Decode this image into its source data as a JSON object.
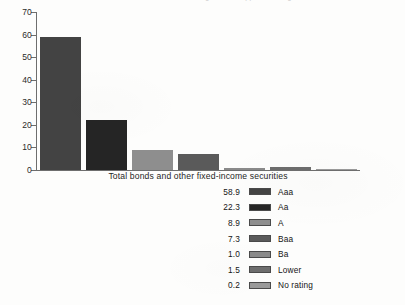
{
  "chart_data": {
    "type": "bar",
    "title": "",
    "subtitle": "",
    "xlabel": "Total bonds and other fixed-income securities",
    "ylabel": "",
    "categories": [
      "Aaa",
      "Aa",
      "A",
      "Baa",
      "Ba",
      "Lower",
      "No rating"
    ],
    "values": [
      58.9,
      22.3,
      8.9,
      7.3,
      1.0,
      1.5,
      0.2
    ],
    "value_labels": [
      "58.9",
      "22.3",
      "8.9",
      "7.3",
      "1.0",
      "1.5",
      "0.2"
    ],
    "ylim": [
      0,
      70
    ],
    "yticks": [
      0,
      10,
      20,
      30,
      40,
      50,
      60,
      70
    ],
    "ytick_labels": [
      "0",
      "10",
      "20",
      "30",
      "40",
      "50",
      "60",
      "70"
    ],
    "grid": false,
    "legend_position": "below",
    "series": [
      {
        "name": "Total bonds and other fixed-income securities",
        "values": [
          58.9,
          22.3,
          8.9,
          7.3,
          1.0,
          1.5,
          0.2
        ]
      }
    ],
    "bar_colors": [
      "#434343",
      "#252525",
      "#8e8e8e",
      "#5a5a5a",
      "#8a8a8a",
      "#6d6d6d",
      "#9a9a9a"
    ]
  },
  "top_cut_text": "fragment of clipped heading text",
  "legend": {
    "rows": [
      {
        "value": "58.9",
        "label": "Aaa",
        "color": "#434343"
      },
      {
        "value": "22.3",
        "label": "Aa",
        "color": "#252525"
      },
      {
        "value": "8.9",
        "label": "A",
        "color": "#8e8e8e"
      },
      {
        "value": "7.3",
        "label": "Baa",
        "color": "#5a5a5a"
      },
      {
        "value": "1.0",
        "label": "Ba",
        "color": "#8a8a8a"
      },
      {
        "value": "1.5",
        "label": "Lower",
        "color": "#6d6d6d"
      },
      {
        "value": "0.2",
        "label": "No rating",
        "color": "#9a9a9a"
      }
    ]
  },
  "axis": {
    "line_color": "#6e6e6e"
  }
}
